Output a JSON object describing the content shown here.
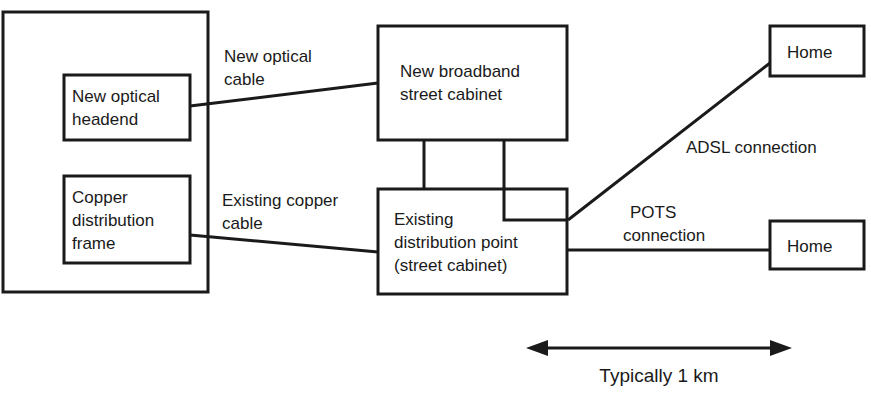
{
  "diagram": {
    "colors": {
      "stroke": "#1a1a1a",
      "fill": "#ffffff",
      "text": "#1a1a1a"
    },
    "nodes": {
      "exchange_container": {
        "label": ""
      },
      "optical_headend": {
        "line1": "New optical",
        "line2": "headend"
      },
      "copper_distribution_frame": {
        "line1": "Copper",
        "line2": "distribution",
        "line3": "frame"
      },
      "broadband_cabinet": {
        "line1": "New broadband",
        "line2": "street cabinet"
      },
      "distribution_point": {
        "line1": "Existing",
        "line2": "distribution point",
        "line3": "(street cabinet)"
      },
      "home_top": {
        "label": "Home"
      },
      "home_bottom": {
        "label": "Home"
      }
    },
    "edges": {
      "optical_cable": {
        "line1": "New optical",
        "line2": "cable"
      },
      "copper_cable": {
        "line1": "Existing copper",
        "line2": "cable"
      },
      "adsl": {
        "label": "ADSL connection"
      },
      "pots": {
        "line1": "POTS",
        "line2": "connection"
      }
    },
    "scale": {
      "label": "Typically 1 km"
    }
  }
}
